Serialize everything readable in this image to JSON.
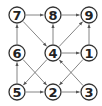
{
  "diagram": {
    "type": "directed-graph",
    "nodes": [
      {
        "id": "7",
        "label": "7",
        "x": 17,
        "y": 15
      },
      {
        "id": "8",
        "label": "8",
        "x": 53,
        "y": 15
      },
      {
        "id": "9",
        "label": "9",
        "x": 89,
        "y": 15
      },
      {
        "id": "6",
        "label": "6",
        "x": 17,
        "y": 53
      },
      {
        "id": "4",
        "label": "4",
        "x": 53,
        "y": 53
      },
      {
        "id": "1",
        "label": "1",
        "x": 89,
        "y": 53
      },
      {
        "id": "5",
        "label": "5",
        "x": 17,
        "y": 92
      },
      {
        "id": "2",
        "label": "2",
        "x": 53,
        "y": 92
      },
      {
        "id": "3",
        "label": "3",
        "x": 89,
        "y": 92
      }
    ],
    "edges": [
      {
        "from": "7",
        "to": "8"
      },
      {
        "from": "8",
        "to": "9"
      },
      {
        "from": "7",
        "to": "4"
      },
      {
        "from": "6",
        "to": "7"
      },
      {
        "from": "4",
        "to": "8"
      },
      {
        "from": "1",
        "to": "9"
      },
      {
        "from": "4",
        "to": "9"
      },
      {
        "from": "4",
        "to": "1"
      },
      {
        "from": "5",
        "to": "6"
      },
      {
        "from": "5",
        "to": "2"
      },
      {
        "from": "2",
        "to": "3"
      },
      {
        "from": "6",
        "to": "2"
      },
      {
        "from": "4",
        "to": "5"
      },
      {
        "from": "3",
        "to": "4"
      },
      {
        "from": "1",
        "to": "2"
      }
    ],
    "node_radius": 8,
    "colors": {
      "stroke": "#333333",
      "edge": "#666666",
      "text": "#222222",
      "background": "#ffffff"
    }
  }
}
